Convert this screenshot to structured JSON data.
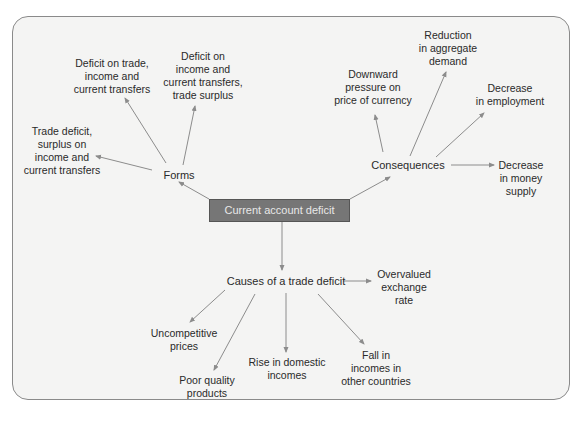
{
  "diagram": {
    "center": {
      "label": "Current account deficit"
    },
    "forms": {
      "label": "Forms",
      "children": [
        {
          "label": "Trade deficit,\nsurplus on\nincome and\ncurrent transfers"
        },
        {
          "label": "Deficit on trade,\nincome and\ncurrent transfers"
        },
        {
          "label": "Deficit on\nincome and\ncurrent transfers,\ntrade surplus"
        }
      ]
    },
    "consequences": {
      "label": "Consequences",
      "children": [
        {
          "label": "Downward\npressure on\nprice of currency"
        },
        {
          "label": "Reduction\nin aggregate\ndemand"
        },
        {
          "label": "Decrease\nin employment"
        },
        {
          "label": "Decrease\nin money supply"
        }
      ]
    },
    "causes": {
      "label": "Causes of a trade deficit",
      "children": [
        {
          "label": "Overvalued\nexchange\nrate"
        },
        {
          "label": "Uncompetitive\nprices"
        },
        {
          "label": "Poor quality\nproducts"
        },
        {
          "label": "Rise in domestic\nincomes"
        },
        {
          "label": "Fall in\nincomes in\nother countries"
        }
      ]
    },
    "colors": {
      "panel_bg": "#f4f4f3",
      "panel_border": "#8a8a8a",
      "center_box_bg": "#767676",
      "center_box_text": "#e8e8e8",
      "arrow": "#8c8c8c",
      "text": "#2a2a2a"
    }
  }
}
